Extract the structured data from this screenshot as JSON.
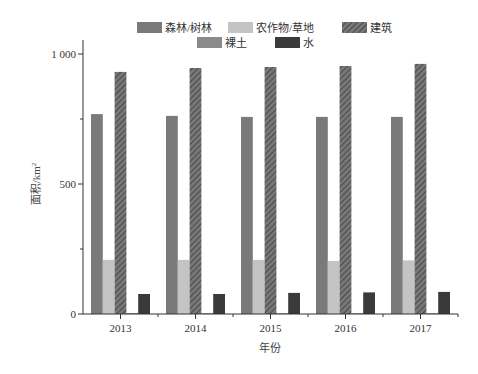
{
  "chart_data": {
    "type": "bar",
    "title": "",
    "xlabel": "年份",
    "ylabel": "面积/km²",
    "ylim": [
      0,
      1100
    ],
    "yticks": [
      0,
      500,
      1000
    ],
    "ytick_labels": [
      "0",
      "500",
      "1 000"
    ],
    "yminor_ticks": [
      250,
      750
    ],
    "categories": [
      "2013",
      "2014",
      "2015",
      "2016",
      "2017"
    ],
    "series": [
      {
        "name": "森林/树林",
        "color": "#7a7a7a",
        "pattern": "solid",
        "values": [
          769,
          762,
          758,
          758,
          758
        ]
      },
      {
        "name": "农作物/草地",
        "color": "#c4c4c4",
        "pattern": "solid",
        "values": [
          208,
          208,
          208,
          204,
          206
        ]
      },
      {
        "name": "建筑",
        "color": "#6e6e6e",
        "pattern": "hatch",
        "values": [
          931,
          946,
          950,
          954,
          962
        ]
      },
      {
        "name": "裸土",
        "color": "#8a8a8a",
        "pattern": "solid",
        "values": [
          4,
          3,
          3,
          3,
          3
        ]
      },
      {
        "name": "水",
        "color": "#3a3a3a",
        "pattern": "solid",
        "values": [
          77,
          77,
          81,
          83,
          85
        ]
      }
    ],
    "legend": {
      "position": "top",
      "rows": [
        [
          "森林/树林",
          "农作物/草地",
          "建筑"
        ],
        [
          "裸土",
          "水"
        ]
      ]
    },
    "grid": false
  }
}
